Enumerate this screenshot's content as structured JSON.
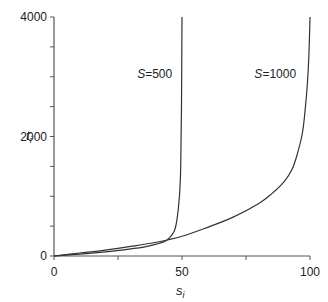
{
  "chart_data": {
    "type": "line",
    "title": "",
    "xlabel": "s_i",
    "ylabel": "t_i",
    "xlim": [
      0,
      100
    ],
    "ylim": [
      0,
      4000
    ],
    "grid": false,
    "legend": "none (inline curve labels)",
    "x_ticks": [
      0,
      25,
      50,
      75,
      100
    ],
    "x_tick_labels": [
      "0",
      "",
      "50",
      "",
      "100"
    ],
    "y_ticks": [
      0,
      500,
      1000,
      1500,
      2000,
      2500,
      3000,
      3500,
      4000
    ],
    "y_tick_labels": [
      "0",
      "",
      "",
      "",
      "2000",
      "",
      "",
      "",
      "4000"
    ],
    "series": [
      {
        "name": "S=500",
        "label_italic": "S",
        "label_rest": "=500",
        "x": [
          0,
          10,
          20,
          30,
          35,
          40,
          43,
          45,
          47,
          48,
          49,
          49.5,
          49.8,
          50
        ],
        "y": [
          0,
          30,
          70,
          120,
          150,
          200,
          240,
          300,
          420,
          600,
          1000,
          1500,
          2500,
          4000
        ]
      },
      {
        "name": "S=1000",
        "label_italic": "S",
        "label_rest": "=1000",
        "x": [
          0,
          10,
          20,
          30,
          40,
          50,
          60,
          70,
          80,
          85,
          90,
          93,
          95,
          97,
          98,
          99,
          99.6,
          100
        ],
        "y": [
          0,
          50,
          100,
          160,
          230,
          330,
          480,
          650,
          880,
          1040,
          1250,
          1450,
          1700,
          2050,
          2400,
          2900,
          3400,
          4000
        ]
      }
    ],
    "annotations": [
      {
        "text": "S=500",
        "x": 45,
        "y": 3300
      },
      {
        "text": "S=1000",
        "x": 93,
        "y": 3300
      }
    ]
  },
  "axes": {
    "x_label_main": "s",
    "x_label_sub": "i",
    "y_label_main": "t",
    "y_label_sub": "i"
  }
}
